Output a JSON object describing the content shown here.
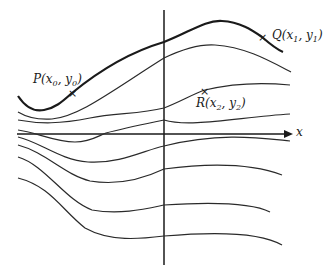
{
  "diagram": {
    "type": "family of integral curves / level curves in the plane",
    "axes": {
      "x_label": "x",
      "y_label": ""
    },
    "points": [
      {
        "id": "P",
        "label": "P",
        "coords": "(x0, y0)",
        "sub_x": "0",
        "sub_y": "0",
        "marker": "×"
      },
      {
        "id": "Q",
        "label": "Q",
        "coords": "(x1, y1)",
        "sub_x": "1",
        "sub_y": "1",
        "marker": "×"
      },
      {
        "id": "R",
        "label": "R",
        "coords": "(x2, y2)",
        "sub_x": "2",
        "sub_y": "2",
        "marker": "×"
      }
    ],
    "curve_count": 8,
    "highlighted_curve": "curve through P and Q (bold)",
    "colors": {
      "stroke": "#1a1a1a",
      "background": "#ffffff"
    }
  }
}
